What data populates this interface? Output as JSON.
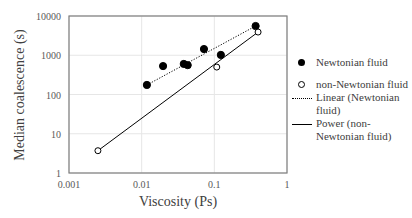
{
  "chart_data": {
    "type": "scatter",
    "title": "",
    "xlabel": "Viscosity (Ps)",
    "ylabel": "Median coalescence (s)",
    "xscale": "log",
    "yscale": "log",
    "xlim": [
      0.001,
      1
    ],
    "ylim": [
      1,
      10000
    ],
    "xticks": [
      "0.001",
      "0.01",
      "0.1",
      "1"
    ],
    "yticks": [
      "1",
      "10",
      "100",
      "1000",
      "10000"
    ],
    "grid": true,
    "legend_position": "right",
    "series": [
      {
        "name": "Newtonian fluid",
        "marker": "filled-circle",
        "points": [
          {
            "x": 0.0118,
            "y": 175
          },
          {
            "x": 0.0197,
            "y": 530
          },
          {
            "x": 0.038,
            "y": 600
          },
          {
            "x": 0.043,
            "y": 560
          },
          {
            "x": 0.072,
            "y": 1440
          },
          {
            "x": 0.123,
            "y": 1020
          },
          {
            "x": 0.37,
            "y": 5560
          }
        ]
      },
      {
        "name": "non-Newtonian fluid",
        "marker": "open-circle",
        "points": [
          {
            "x": 0.0025,
            "y": 3.7
          },
          {
            "x": 0.108,
            "y": 500
          },
          {
            "x": 0.4,
            "y": 3900
          }
        ]
      }
    ],
    "trendlines": [
      {
        "name": "Linear (Newtonian fluid)",
        "style": "dotted",
        "from": {
          "x": 0.0118,
          "y": 175
        },
        "to": {
          "x": 0.37,
          "y": 5560
        }
      },
      {
        "name": "Power (non-Newtonian fluid)",
        "style": "solid",
        "from": {
          "x": 0.0025,
          "y": 3.7
        },
        "to": {
          "x": 0.4,
          "y": 3900
        }
      }
    ]
  },
  "legend": {
    "items": [
      {
        "label": "Newtonian fluid",
        "symbol": "filled-circle"
      },
      {
        "label": "non-Newtonian fluid",
        "symbol": "open-circle"
      },
      {
        "label": "Linear (Newtonian fluid)",
        "symbol": "dotted-line"
      },
      {
        "label": "Power (non-Newtonian fluid)",
        "symbol": "solid-line"
      }
    ]
  },
  "colors": {
    "frame": "#7f7f7f",
    "grid": "#e6e6e6",
    "marker": "#000000",
    "text": "#404040"
  }
}
